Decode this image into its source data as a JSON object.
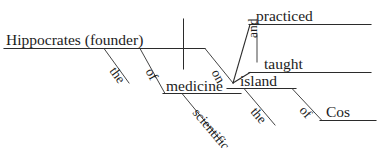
{
  "diagram": {
    "type": "reed-kellogg-sentence-diagram",
    "sentence": "Hippocrates (founder) of the scientific medicine practiced and taught on the island of Cos",
    "ink_color": "#2b2b2b",
    "background_color": "#ffffff",
    "subject": {
      "label": "Hippocrates (founder)",
      "role": "subject-with-appositive"
    },
    "verbs": [
      {
        "label": "practiced",
        "role": "compound-verb-upper"
      },
      {
        "label": "taught",
        "role": "compound-verb-lower"
      }
    ],
    "conjunction": {
      "label": "and",
      "role": "coordinating-conjunction",
      "orientation": "vertical"
    },
    "modifiers": [
      {
        "label": "the",
        "role": "article-modifying-founder",
        "attaches_to": "Hippocrates (founder)"
      },
      {
        "label": "of",
        "role": "preposition-modifying-founder",
        "attaches_to": "Hippocrates (founder)"
      },
      {
        "label": "medicine",
        "role": "object-of-preposition-of"
      },
      {
        "label": "scientific",
        "role": "adjective-modifying-medicine"
      },
      {
        "label": "on",
        "role": "preposition-modifying-verbs"
      },
      {
        "label": "island",
        "role": "object-of-preposition-on"
      },
      {
        "label": "the",
        "role": "article-modifying-island"
      },
      {
        "label": "of",
        "role": "preposition-modifying-island"
      },
      {
        "label": "Cos",
        "role": "object-of-preposition-of-second"
      }
    ]
  }
}
